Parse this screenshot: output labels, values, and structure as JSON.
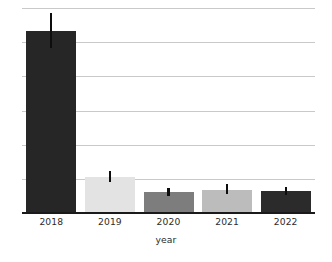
{
  "chart_data": {
    "type": "bar",
    "title": "",
    "xlabel": "year",
    "ylabel": "",
    "categories": [
      "2018",
      "2019",
      "2020",
      "2021",
      "2022"
    ],
    "values": [
      6.0,
      1.18,
      0.68,
      0.76,
      0.72
    ],
    "errors_low": [
      0.56,
      0.17,
      0.12,
      0.15,
      0.13
    ],
    "errors_high": [
      0.58,
      0.21,
      0.15,
      0.18,
      0.14
    ],
    "bar_colors": [
      "#262626",
      "#e3e3e3",
      "#7d7d7d",
      "#bcbcbc",
      "#2b2b2b"
    ],
    "error_color": "#0d0d0d",
    "ylim": [
      0,
      6.75
    ],
    "yticks": [
      0,
      1.125,
      2.25,
      3.375,
      4.5,
      5.625,
      6.75
    ],
    "grid": true,
    "grid_color": "#c9c9c9",
    "axis_color": "#1a1a1a",
    "legend": "none",
    "background": "#ffffff",
    "bar_width_px": 50
  },
  "axes": {
    "x_title": "year",
    "tick_labels": [
      "2018",
      "2019",
      "2020",
      "2021",
      "2022"
    ]
  }
}
